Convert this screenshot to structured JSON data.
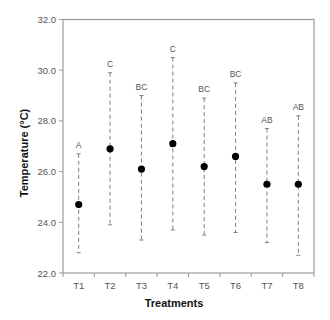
{
  "chart_data": {
    "type": "scatter",
    "subtype": "mean-with-error-bars",
    "title": "",
    "xlabel": "Treatments",
    "ylabel": "Temperature (°C)",
    "ylim": [
      22.0,
      32.0
    ],
    "yticks": [
      "22.0",
      "24.0",
      "26.0",
      "28.0",
      "30.0",
      "32.0"
    ],
    "categories": [
      "T1",
      "T2",
      "T3",
      "T4",
      "T5",
      "T6",
      "T7",
      "T8"
    ],
    "values": [
      24.7,
      26.9,
      26.1,
      27.1,
      26.2,
      26.6,
      25.5,
      25.5
    ],
    "lower": [
      22.8,
      23.9,
      23.3,
      23.7,
      23.5,
      23.6,
      23.2,
      22.7
    ],
    "upper": [
      26.7,
      29.9,
      29.0,
      30.5,
      28.9,
      29.5,
      27.7,
      28.2
    ],
    "significance_letters": [
      "A",
      "C",
      "BC",
      "C",
      "BC",
      "BC",
      "AB",
      "AB"
    ],
    "grid": false,
    "legend": "none",
    "colors": {
      "points": "#000000",
      "error_bars": "#808080",
      "frame": "#999999",
      "tick_text": "#555555",
      "axis_title": "#111111"
    }
  }
}
